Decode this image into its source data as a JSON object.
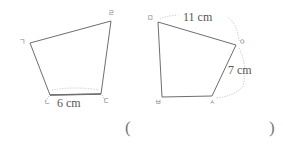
{
  "figure": {
    "background_color": "#ffffff",
    "stroke_color": "#6e6e6e",
    "dotted_color": "#b9b9b9",
    "text_color": "#5a5a5a",
    "shapes": [
      {
        "name": "left-quadrilateral",
        "vertices": [
          {
            "label": "ㄱ",
            "x": 30,
            "y": 43
          },
          {
            "label": "ㄹ",
            "x": 111,
            "y": 21
          },
          {
            "label": "ㄷ",
            "x": 101,
            "y": 94
          },
          {
            "label": "ㄴ",
            "x": 50,
            "y": 95
          }
        ],
        "dimensions": [
          {
            "name": "bottom-edge-length",
            "value": "6 cm",
            "edge": "ㄴㄷ"
          }
        ]
      },
      {
        "name": "right-quadrilateral",
        "vertices": [
          {
            "label": "ㅁ",
            "x": 158,
            "y": 22
          },
          {
            "label": "ㅇ",
            "x": 236,
            "y": 45
          },
          {
            "label": "ㅅ",
            "x": 212,
            "y": 96
          },
          {
            "label": "ㅂ",
            "x": 162,
            "y": 97
          }
        ],
        "dimensions": [
          {
            "name": "top-edge-length",
            "value": "11 cm",
            "edge": "ㅁㅇ"
          },
          {
            "name": "right-edge-length",
            "value": "7 cm",
            "edge": "ㅇㅅ"
          }
        ]
      }
    ]
  },
  "labels": {
    "left_vertex_a": "ㄱ",
    "left_vertex_b": "ㄴ",
    "left_vertex_c": "ㄷ",
    "left_vertex_d": "ㄹ",
    "right_vertex_a": "ㅁ",
    "right_vertex_b": "ㅂ",
    "right_vertex_c": "ㅅ",
    "right_vertex_d": "ㅇ"
  },
  "measurements": {
    "left_bottom": "6 cm",
    "right_top": "11 cm",
    "right_side": "7 cm"
  },
  "answer_blank": {
    "open_paren": "(",
    "close_paren": ")"
  }
}
